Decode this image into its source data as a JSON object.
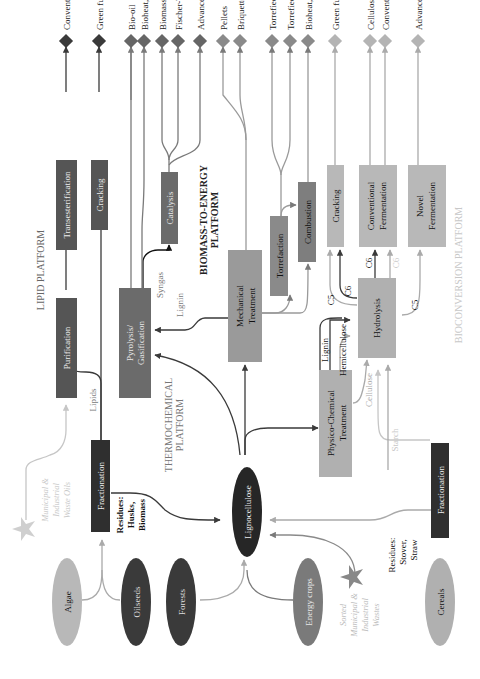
{
  "colors": {
    "dark": "#3a3a3a",
    "mid_dark": "#5e5e5e",
    "mid": "#808080",
    "light": "#a9a9a9",
    "lighter": "#c4c4c4",
    "black_node": "#262626",
    "platform_label_light": "#c8c8c8"
  },
  "platforms": {
    "lipid": "LIPID PLATFORM",
    "thermochemical_1": "THERMOCHEMICAL",
    "thermochemical_2": "PLATFORM",
    "biomass_to_energy_1": "BIOMASS-TO-ENERGY",
    "biomass_to_energy_2": "PLATFORM",
    "bioconversion": "BIOCONVERSION PLATFORM"
  },
  "sources": {
    "algae": "Algae",
    "oilseeds": "Oilseeds",
    "forests": "Forests",
    "energy_crops": "Energy crops",
    "cereals": "Cereals",
    "waste_oils": [
      "Municipal &",
      "Industrial",
      "Waste Oils"
    ],
    "sorted_wastes": [
      "Sorted",
      "Municipal &",
      "Industrial",
      "Wastes"
    ]
  },
  "hub": {
    "lignocellulose": "Lignocellulose"
  },
  "processes": {
    "fractionation_lipid": "Fractionation",
    "purification": "Purification",
    "transesterification": "Transesterification",
    "cracking_lipid": "Cracking",
    "pyrolysis": [
      "Pyrolysis/",
      "Gasification"
    ],
    "catalysis": "Catalysis",
    "mechanical": [
      "Mechanical",
      "Treatment"
    ],
    "torrefaction": "Torrefaction",
    "combustion": "Combustion",
    "physico_chemical": [
      "Physico-Chemical",
      "Treatment"
    ],
    "hydrolysis": "Hydrolysis",
    "cracking_bio": "Cracking",
    "conventional_fermentation": [
      "Conventional",
      "Fermentation"
    ],
    "novel_fermentation": [
      "Novel",
      "Fermentation"
    ],
    "fractionation_cereal": "Fractionation"
  },
  "flow_labels": {
    "lipids": "Lipids",
    "residues_husks": [
      "Residues:",
      "Husks,",
      "Biomass"
    ],
    "residues_stover": [
      "Residues:",
      "Stover,",
      "Straw"
    ],
    "syngas": "Syngas",
    "lignin_pyro": "Lignin",
    "lignin": "Lignin",
    "hemicellulose": "Hemicellulose",
    "cellulose": "Cellulose",
    "starch": "Starch",
    "c5_a": "C5",
    "c6_a": "C6",
    "c6_b": "C6",
    "c6_c": "C6",
    "c5_b": "C5"
  },
  "products": [
    {
      "label": "Conventional biodiesel",
      "shade": "dark"
    },
    {
      "label": "Green fuels",
      "shade": "dark"
    },
    {
      "label": "Bio-oil",
      "shade": "mid_dark"
    },
    {
      "label": "Bioheat, bioelectricity",
      "shade": "mid_dark"
    },
    {
      "label": "Biomass-to-liquid (BTL)",
      "shade": "mid_dark"
    },
    {
      "label": "Fischer-Tropsch fuels",
      "shade": "mid_dark"
    },
    {
      "label": "Advanced bioproducts",
      "shade": "mid_dark"
    },
    {
      "label": "Pellets",
      "shade": "mid"
    },
    {
      "label": "Briquettes",
      "shade": "mid"
    },
    {
      "label": "Torrefied Pellets",
      "shade": "mid"
    },
    {
      "label": "Torrefied Briquettes",
      "shade": "mid"
    },
    {
      "label": "Bioheat, bioelectricity",
      "shade": "mid"
    },
    {
      "label": "Green fuels",
      "shade": "light"
    },
    {
      "label": "Cellulosic ethanol",
      "shade": "light"
    },
    {
      "label": "Conventional ethanol",
      "shade": "light"
    },
    {
      "label": "Advanced bioproducts",
      "shade": "light"
    }
  ]
}
